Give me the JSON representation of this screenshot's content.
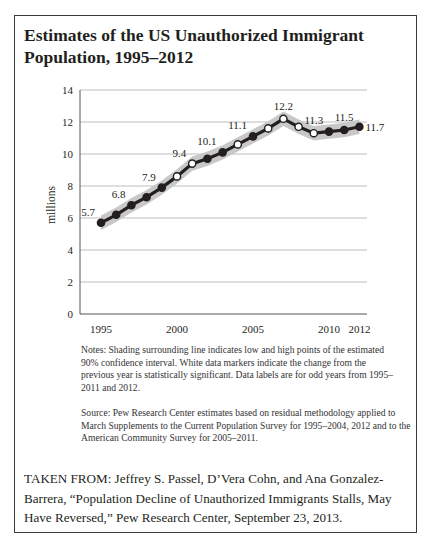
{
  "title": "Estimates of the US Unauthorized Immigrant Population, 1995–2012",
  "notes": "Notes: Shading surrounding line indicates low and high points of the estimated 90% confidence interval. White data markers indicate the change from the previous year is statistically significant. Data labels are for odd years from 1995–2011 and 2012.",
  "source": "Source: Pew Research Center estimates based on residual methodology applied to March Supplements to the Current Population Survey for 1995–2004, 2012 and to the American Community Survey for 2005–2011.",
  "taken_from": "TAKEN FROM: Jeffrey S. Passel, D’Vera Cohn, and Ana Gonzalez-Barrera, “Population Decline of Unauthorized Immigrants Stalls, May Have Reversed,” Pew Research Center, September 23, 2013.",
  "colors": {
    "line": "#231f20",
    "band": "#c8c8c8",
    "grid": "#bdbdbd",
    "marker_significant": "#ffffff",
    "marker_default": "#231f20"
  },
  "chart_data": {
    "type": "line",
    "title": "Estimates of the US Unauthorized Immigrant Population, 1995–2012",
    "xlabel": "",
    "ylabel": "millions",
    "ylim": [
      0,
      14
    ],
    "yticks": [
      0,
      2,
      4,
      6,
      8,
      10,
      12,
      14
    ],
    "xlim": [
      1995,
      2012
    ],
    "xticks": [
      1995,
      2000,
      2005,
      2010,
      2012
    ],
    "grid": true,
    "legend": "none",
    "x": [
      1995,
      1996,
      1997,
      1998,
      1999,
      2000,
      2001,
      2002,
      2003,
      2004,
      2005,
      2006,
      2007,
      2008,
      2009,
      2010,
      2011,
      2012
    ],
    "series": [
      {
        "name": "Unauthorized immigrant population (millions)",
        "values": [
          5.7,
          6.2,
          6.8,
          7.3,
          7.9,
          8.6,
          9.4,
          9.7,
          10.1,
          10.6,
          11.1,
          11.6,
          12.2,
          11.7,
          11.3,
          11.4,
          11.5,
          11.7
        ],
        "significant_change": [
          false,
          false,
          false,
          false,
          false,
          true,
          true,
          false,
          false,
          true,
          false,
          true,
          true,
          true,
          true,
          false,
          false,
          false
        ],
        "ci_halfwidth": 0.45
      }
    ],
    "data_labels": [
      {
        "x": 1995,
        "label": "5.7"
      },
      {
        "x": 1997,
        "label": "6.8"
      },
      {
        "x": 1999,
        "label": "7.9"
      },
      {
        "x": 2001,
        "label": "9.4"
      },
      {
        "x": 2003,
        "label": "10.1"
      },
      {
        "x": 2005,
        "label": "11.1"
      },
      {
        "x": 2007,
        "label": "12.2"
      },
      {
        "x": 2009,
        "label": "11.3"
      },
      {
        "x": 2011,
        "label": "11.5"
      },
      {
        "x": 2012,
        "label": "11.7"
      }
    ]
  }
}
